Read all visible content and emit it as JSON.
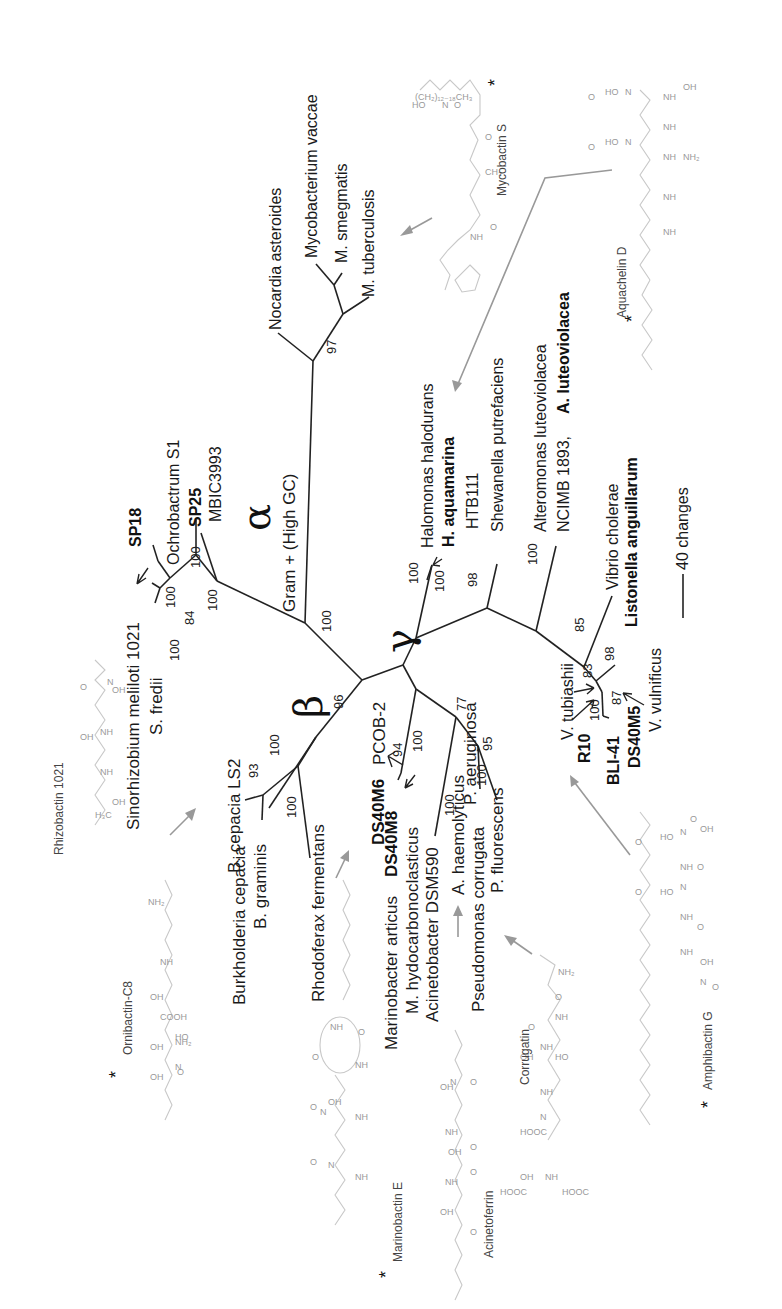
{
  "figure": {
    "orientation": "rotated 90 degrees counter-clockwise",
    "scale_bar": {
      "label": "40 changes"
    },
    "clades": {
      "alpha": "α",
      "beta": "β",
      "gamma": "γ",
      "gram_pos": "Gram + (High GC)"
    },
    "taxa": {
      "nocardia": "Nocardia asteroides",
      "myco_vaccae": "Mycobacterium vaccae",
      "m_smegmatis": "M. smegmatis",
      "m_tuberculosis": "M. tuberculosis",
      "ochrobactrum": "Ochrobactrum S1",
      "sp25": "SP25",
      "mbic3993": "MBIC3993",
      "sp18": "SP18",
      "sinorhizobium": "Sinorhizobium meliloti 1021",
      "s_fredii": "S. fredii",
      "b_cepacia_ls2": "B. cepacia LS2",
      "burk_cepacia": "Burkholderia cepacia",
      "b_graminis": "B. graminis",
      "rhodoferax": "Rhodoferax fermentans",
      "ds40m6": "DS40M6",
      "pcob2": "PCOB-2",
      "ds40m8": "DS40M8",
      "marinobacter_articus": "Marinobacter articus",
      "m_hydrocarbon": "M. hydocarbonoclasticus",
      "acinetobacter": "Acinetobacter DSM590",
      "a_haemolyticus": "A. haemolyticus",
      "pseudo_corrugata": "Pseudomonas corrugata",
      "p_fluorescens": "P. fluorescens",
      "p_aeruginosa": "P. aeruginosa",
      "halomonas": "Halomonas halodurans",
      "h_aquamarina": "H. aquamarina",
      "htb111": "HTB111",
      "shewanella": "Shewanella putrefaciens",
      "alteromonas": "Alteromonas luteoviolacea",
      "ncimb": "NCIMB 1893,",
      "a_luteoviolacea": "A. luteoviolacea",
      "vibrio_cholerae": "Vibrio cholerae",
      "listonella": "Listonella anguillarum",
      "v_tubiashii": "V. tubiashii",
      "r10": "R10",
      "bli41": "BLI-41",
      "ds40m5": "DS40M5",
      "v_vulnificus": "V. vulnificus"
    },
    "bootstrap": {
      "b97": "97",
      "b100_gram": "100",
      "b100_alpha": "100",
      "b100_ochro": "100",
      "b100_sino": "100",
      "b84": "84",
      "b100_sfred": "100",
      "b96": "96",
      "b93": "93",
      "b100_bc1": "100",
      "b100_bc2": "100",
      "b94": "94",
      "b100_mar": "100",
      "b77": "77",
      "b95": "95",
      "b100_pseu": "100",
      "b100_acin": "100",
      "b100_halo1": "100",
      "b100_halo2": "100",
      "b98_shew": "98",
      "b100_alt": "100",
      "b85": "85",
      "b98_vib": "98",
      "b83": "83",
      "b100_r10": "100",
      "b87": "87"
    },
    "siderophores": {
      "mycobactin": "Mycobactin S",
      "aquachelin": "Aquachelin D",
      "rhizobactin": "Rhizobactin 1021",
      "ornibactin": "Ornibactin-C8",
      "marinobactin": "Marinobactin E",
      "acinetoferrin": "Acinetoferrin",
      "corrugatin": "Corrugatin",
      "amphibactin": "Amphibactin G",
      "star": "*"
    }
  }
}
